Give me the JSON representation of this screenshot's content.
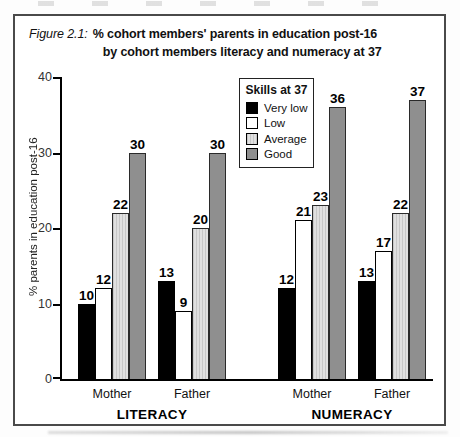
{
  "figure": {
    "label": "Figure 2.1:",
    "title_line1": "% cohort members' parents in education post-16",
    "title_line2": "by cohort members literacy and numeracy at 37"
  },
  "chart_data": {
    "type": "bar",
    "title": "Figure 2.1: % cohort members' parents in education post-16 by cohort members literacy and numeracy at 37",
    "xlabel": "",
    "ylabel": "% parents in education post-16",
    "ylim": [
      0,
      40
    ],
    "yticks": [
      0,
      10,
      20,
      30,
      40
    ],
    "grid": false,
    "legend_title": "Skills at 37",
    "legend_position": "top-right-inside",
    "series": [
      {
        "name": "Very low",
        "color": "#000000",
        "pattern": "solid"
      },
      {
        "name": "Low",
        "color": "#ffffff",
        "pattern": "solid-outlined"
      },
      {
        "name": "Average",
        "color": "#dcdcdc",
        "pattern": "fine-vertical-stripes"
      },
      {
        "name": "Good",
        "color": "#8f8f8f",
        "pattern": "solid"
      }
    ],
    "groups": [
      {
        "label": "LITERACY",
        "subgroups": [
          {
            "label": "Mother",
            "values": [
              10,
              12,
              22,
              30
            ]
          },
          {
            "label": "Father",
            "values": [
              13,
              9,
              20,
              30
            ]
          }
        ]
      },
      {
        "label": "NUMERACY",
        "subgroups": [
          {
            "label": "Mother",
            "values": [
              12,
              21,
              23,
              36
            ]
          },
          {
            "label": "Father",
            "values": [
              13,
              17,
              22,
              37
            ]
          }
        ]
      }
    ]
  }
}
